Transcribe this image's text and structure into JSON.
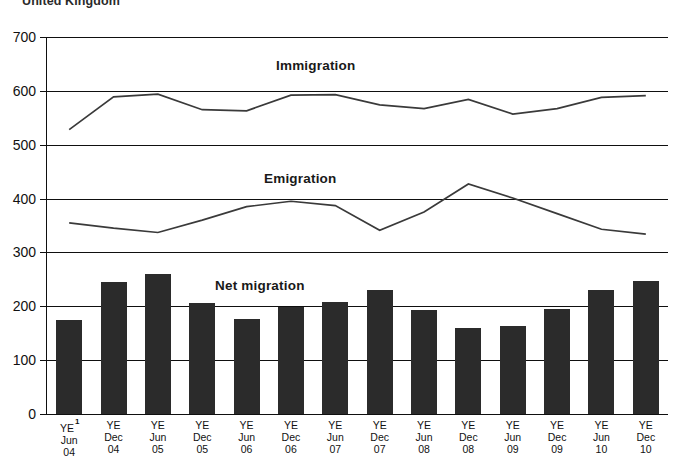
{
  "chart_title": "United Kingdom",
  "series_labels": {
    "immigration": "Immigration",
    "emigration": "Emigration",
    "net_migration": "Net migration"
  },
  "footnote_marker": "1",
  "axis": {
    "y_ticks": [
      0,
      100,
      200,
      300,
      400,
      500,
      600,
      700
    ],
    "y_tick_labels": [
      "0",
      "100",
      "200",
      "300",
      "400",
      "500",
      "600",
      "700"
    ]
  },
  "x_labels": [
    {
      "l1": "YE",
      "l2": "Jun",
      "l3": "04"
    },
    {
      "l1": "YE",
      "l2": "Dec",
      "l3": "04"
    },
    {
      "l1": "YE",
      "l2": "Jun",
      "l3": "05"
    },
    {
      "l1": "YE",
      "l2": "Dec",
      "l3": "05"
    },
    {
      "l1": "YE",
      "l2": "Jun",
      "l3": "06"
    },
    {
      "l1": "YE",
      "l2": "Dec",
      "l3": "06"
    },
    {
      "l1": "YE",
      "l2": "Jun",
      "l3": "07"
    },
    {
      "l1": "YE",
      "l2": "Dec",
      "l3": "07"
    },
    {
      "l1": "YE",
      "l2": "Jun",
      "l3": "08"
    },
    {
      "l1": "YE",
      "l2": "Dec",
      "l3": "08"
    },
    {
      "l1": "YE",
      "l2": "Jun",
      "l3": "09"
    },
    {
      "l1": "YE",
      "l2": "Dec",
      "l3": "09"
    },
    {
      "l1": "YE",
      "l2": "Jun",
      "l3": "10"
    },
    {
      "l1": "YE",
      "l2": "Dec",
      "l3": "10"
    }
  ],
  "colors": {
    "bar": "#2b2b2b",
    "line": "#3a3a3a",
    "axis": "#0f0f0f",
    "text": "#111111"
  },
  "chart_data": {
    "type": "bar",
    "title": "United Kingdom",
    "xlabel": "",
    "ylabel": "",
    "ylim": [
      0,
      700
    ],
    "grid": true,
    "legend": "inline-labels",
    "categories": [
      "YE Jun 04",
      "YE Dec 04",
      "YE Jun 05",
      "YE Dec 05",
      "YE Jun 06",
      "YE Dec 06",
      "YE Jun 07",
      "YE Dec 07",
      "YE Jun 08",
      "YE Dec 08",
      "YE Jun 09",
      "YE Dec 09",
      "YE Jun 10",
      "YE Dec 10"
    ],
    "series": [
      {
        "name": "Net migration",
        "type": "bar",
        "values": [
          175,
          245,
          260,
          206,
          176,
          199,
          208,
          231,
          194,
          160,
          163,
          195,
          231,
          247
        ]
      },
      {
        "name": "Immigration",
        "type": "line",
        "values": [
          528,
          589,
          594,
          565,
          563,
          592,
          593,
          574,
          567,
          584,
          557,
          567,
          588,
          591
        ]
      },
      {
        "name": "Emigration",
        "type": "line",
        "values": [
          355,
          345,
          337,
          360,
          385,
          395,
          387,
          341,
          375,
          427,
          401,
          372,
          343,
          334
        ]
      }
    ]
  }
}
